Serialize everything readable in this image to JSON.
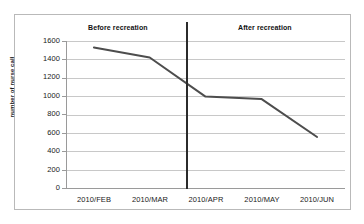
{
  "chart_data": {
    "type": "line",
    "title": "",
    "xlabel": "",
    "ylabel": "number of nurse call",
    "categories": [
      "2010/FEB",
      "2010/MAR",
      "2010/APR",
      "2010/MAY",
      "2010/JUN"
    ],
    "values": [
      1530,
      1420,
      995,
      970,
      555
    ],
    "series": [
      {
        "name": "number of nurse call",
        "values": [
          1530,
          1420,
          995,
          970,
          555
        ]
      }
    ],
    "ylim": [
      0,
      1600
    ],
    "yticks": [
      0,
      200,
      400,
      600,
      800,
      1000,
      1200,
      1400,
      1600
    ],
    "ytick_labels": [
      "0",
      "200",
      "400",
      "600",
      "800",
      "1000",
      "1200",
      "1400",
      "1600"
    ],
    "grid": true,
    "legend": "none",
    "annotations": [
      {
        "text": "Before recreation",
        "region": "left-of-divider"
      },
      {
        "text": "After recreation",
        "region": "right-of-divider"
      }
    ],
    "divider": {
      "label": "recreation-event-divider",
      "between_categories": [
        "2010/MAR",
        "2010/APR"
      ],
      "position_value": 2.55
    },
    "colors": {
      "line": "#4d4d4d",
      "grid": "#c8c8c8",
      "axis": "#9a9a9a",
      "divider": "#2b2b2b",
      "text": "#1a1a1a",
      "background": "#ffffff",
      "frame": "#b9b9b9"
    }
  }
}
